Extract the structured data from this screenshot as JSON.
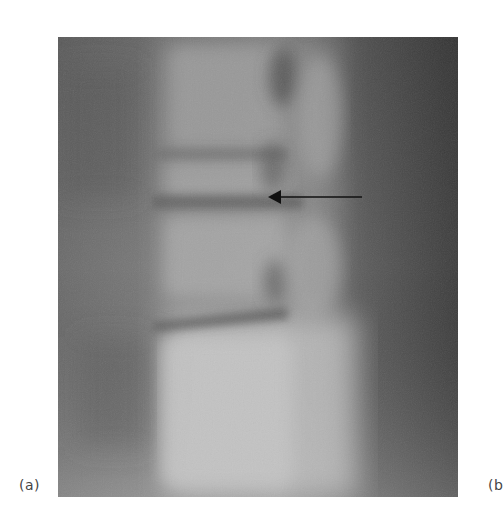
{
  "figure": {
    "panels": [
      {
        "label": "(a)",
        "content": "lateral lumbar spine radiograph",
        "annotation": "arrow pointing left at intervertebral disc space"
      },
      {
        "label": "(b",
        "content": "clipped panel"
      }
    ],
    "arrow": {
      "x1": 362,
      "y1": 197,
      "x2": 268,
      "y2": 197,
      "color": "#111111"
    },
    "colors": {
      "background": "#ffffff",
      "xray_dark": "#4a4a4a",
      "xray_mid": "#7a7a7a",
      "xray_light": "#bdbdbd"
    }
  }
}
